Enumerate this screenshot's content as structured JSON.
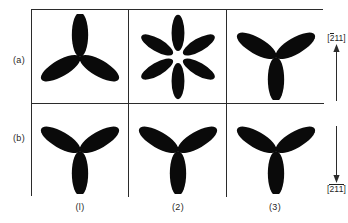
{
  "figure": {
    "row_labels": [
      {
        "id": "a",
        "text": "(a)"
      },
      {
        "id": "b",
        "text": "(b)"
      }
    ],
    "column_labels": [
      {
        "id": "1",
        "text": "(l)"
      },
      {
        "id": "2",
        "text": "(2)"
      },
      {
        "id": "3",
        "text": "(3)"
      }
    ],
    "panels": [
      {
        "row": "a",
        "col": "1",
        "shape": "trefoil-up",
        "lobes": 3
      },
      {
        "row": "a",
        "col": "2",
        "shape": "rosette-six",
        "lobes": 6
      },
      {
        "row": "a",
        "col": "3",
        "shape": "trefoil-down",
        "lobes": 3
      },
      {
        "row": "b",
        "col": "1",
        "shape": "trefoil-down",
        "lobes": 3
      },
      {
        "row": "b",
        "col": "2",
        "shape": "trefoil-down",
        "lobes": 3
      },
      {
        "row": "b",
        "col": "3",
        "shape": "trefoil-down",
        "lobes": 3
      }
    ],
    "directions": [
      {
        "id": "top",
        "arrow": "up-arrow-icon",
        "index_parts": [
          {
            "digit": "2",
            "overbar": true
          },
          {
            "digit": "1",
            "overbar": false
          },
          {
            "digit": "1",
            "overbar": false
          }
        ],
        "bracket_open": "[",
        "bracket_close": "]"
      },
      {
        "id": "bottom",
        "arrow": "down-arrow-icon",
        "index_parts": [
          {
            "digit": "2",
            "overbar": true
          },
          {
            "digit": "1",
            "overbar": true
          },
          {
            "digit": "1",
            "overbar": true
          }
        ],
        "bracket_open": "[",
        "bracket_close": "]"
      }
    ],
    "colors": {
      "ink": "#0a0a0a",
      "rule": "#2b2b2b",
      "background": "#ffffff"
    }
  }
}
